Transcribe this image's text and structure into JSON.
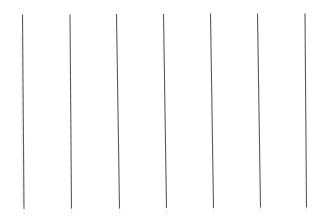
{
  "canvas": {
    "width": 325,
    "height": 217,
    "background_color": "#ffffff",
    "title": ""
  },
  "figure": {
    "name": "vertical-line-set",
    "stroke_color": "#5a5a5a",
    "ghost_stroke_color": "#5a5a5a",
    "stroke_width": 1.1,
    "line_count": 7
  },
  "chart_data": {
    "type": "line",
    "title": "",
    "xlabel": "",
    "ylabel": "",
    "grid": false,
    "legend": null,
    "xlim": [
      0,
      325
    ],
    "ylim": [
      0,
      217
    ],
    "series": [
      {
        "name": "line-1",
        "x1": 22.5,
        "y1": 14.5,
        "x2": 24.0,
        "y2": 209.0,
        "color": "#5a5a5a",
        "width": 1.1
      },
      {
        "name": "line-2",
        "x1": 70.0,
        "y1": 14.5,
        "x2": 71.5,
        "y2": 208.5,
        "color": "#5a5a5a",
        "width": 1.1
      },
      {
        "name": "line-3",
        "x1": 116.5,
        "y1": 14.0,
        "x2": 119.5,
        "y2": 208.5,
        "color": "#5a5a5a",
        "width": 1.1
      },
      {
        "name": "line-4",
        "x1": 163.5,
        "y1": 14.0,
        "x2": 166.5,
        "y2": 208.0,
        "color": "#5a5a5a",
        "width": 1.1
      },
      {
        "name": "line-5",
        "x1": 210.5,
        "y1": 13.5,
        "x2": 213.5,
        "y2": 208.0,
        "color": "#5a5a5a",
        "width": 1.1
      },
      {
        "name": "line-6",
        "x1": 257.5,
        "y1": 13.5,
        "x2": 260.5,
        "y2": 207.5,
        "color": "#5a5a5a",
        "width": 1.1
      },
      {
        "name": "line-7",
        "x1": 305.0,
        "y1": 13.5,
        "x2": 306.5,
        "y2": 207.5,
        "color": "#5a5a5a",
        "width": 1.1
      }
    ],
    "ghosts": [
      {
        "name": "ghost-1",
        "x1": 21.0,
        "y1": 35.0,
        "x2": 22.5,
        "y2": 205.0
      },
      {
        "name": "ghost-2",
        "x1": 23.5,
        "y1": 209.5,
        "x2": 24.5,
        "y2": 215.0
      },
      {
        "name": "ghost-3",
        "x1": 71.0,
        "y1": 209.0,
        "x2": 72.0,
        "y2": 214.5
      },
      {
        "name": "ghost-4",
        "x1": 119.0,
        "y1": 209.0,
        "x2": 120.0,
        "y2": 214.0
      },
      {
        "name": "ghost-5",
        "x1": 166.0,
        "y1": 208.5,
        "x2": 167.0,
        "y2": 214.0
      },
      {
        "name": "ghost-6",
        "x1": 213.0,
        "y1": 208.5,
        "x2": 214.0,
        "y2": 213.5
      },
      {
        "name": "ghost-7",
        "x1": 260.0,
        "y1": 208.0,
        "x2": 261.0,
        "y2": 213.5
      },
      {
        "name": "ghost-8",
        "x1": 306.0,
        "y1": 208.0,
        "x2": 307.0,
        "y2": 213.0
      }
    ]
  }
}
